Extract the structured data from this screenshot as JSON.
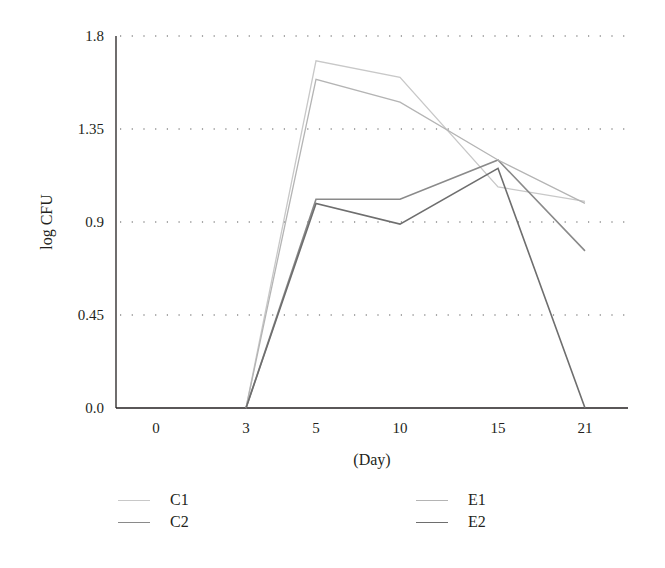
{
  "chart_data": {
    "type": "line",
    "title": "",
    "xlabel": "(Day)",
    "ylabel": "log CFU",
    "categories": [
      "0",
      "3",
      "5",
      "10",
      "15",
      "21"
    ],
    "yticks": [
      "0.0",
      "0.45",
      "0.9",
      "1.35",
      "1.8"
    ],
    "ylim": [
      0,
      1.8
    ],
    "grid": "horizontal dotted",
    "legend_position": "bottom",
    "series": [
      {
        "name": "C1",
        "color": "#c8c8c8",
        "values": [
          null,
          0.0,
          1.68,
          1.6,
          1.07,
          1.0
        ]
      },
      {
        "name": "C2",
        "color": "#8a8a8a",
        "values": [
          null,
          0.0,
          1.01,
          1.01,
          1.2,
          0.76
        ]
      },
      {
        "name": "E1",
        "color": "#b4b4b4",
        "values": [
          null,
          0.0,
          1.59,
          1.48,
          1.2,
          0.99
        ]
      },
      {
        "name": "E2",
        "color": "#6e6e6e",
        "values": [
          null,
          0.0,
          0.99,
          0.89,
          1.16,
          0.0
        ]
      }
    ]
  },
  "axis": {
    "ylabel": "log CFU",
    "xlabel": "(Day)",
    "yticks": [
      "0.0",
      "0.45",
      "0.9",
      "1.35",
      "1.8"
    ],
    "xticks": [
      "0",
      "3",
      "5",
      "10",
      "15",
      "21"
    ]
  },
  "legend": [
    {
      "label": "C1",
      "color": "#c8c8c8"
    },
    {
      "label": "E1",
      "color": "#b4b4b4"
    },
    {
      "label": "C2",
      "color": "#8a8a8a"
    },
    {
      "label": "E2",
      "color": "#6e6e6e"
    }
  ]
}
